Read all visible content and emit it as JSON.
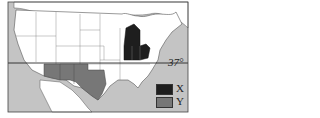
{
  "map": {
    "title": "",
    "latitude_line": {
      "label": "37°",
      "y": 63
    },
    "colors": {
      "ocean": "#c4c4c4",
      "land": "#ffffff",
      "border": "#555555",
      "region_x": "#1e1e1e",
      "region_y": "#777777"
    },
    "regions": [
      {
        "key": "X",
        "states": [
          "Michigan",
          "Indiana",
          "Ohio"
        ]
      },
      {
        "key": "Y",
        "states": [
          "Arizona",
          "New Mexico",
          "Texas"
        ]
      }
    ],
    "legend": [
      {
        "label": "X",
        "color": "#1e1e1e"
      },
      {
        "label": "Y",
        "color": "#777777"
      }
    ]
  }
}
